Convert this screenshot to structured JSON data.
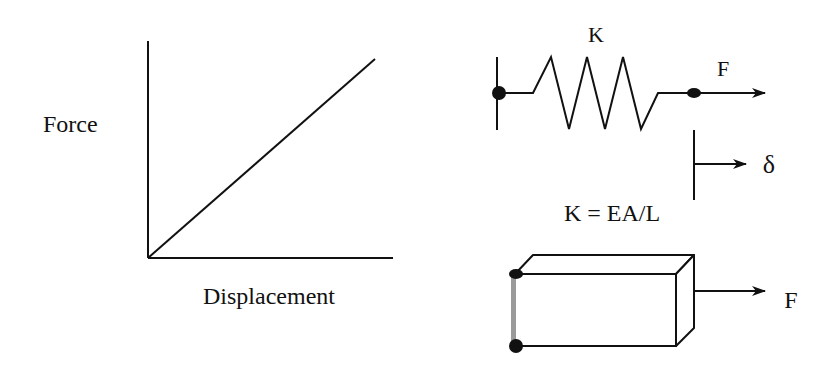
{
  "graph": {
    "y_label": "Force",
    "x_label": "Displacement"
  },
  "spring_model": {
    "stiffness_label": "K",
    "force_label": "F",
    "displacement_label": "δ",
    "formula": "K = EA/L"
  },
  "bar_model": {
    "force_label": "F"
  },
  "colors": {
    "line": "#111111",
    "fixed_face": "#9a9a9a",
    "background": "#ffffff"
  }
}
